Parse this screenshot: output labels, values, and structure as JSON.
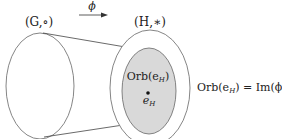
{
  "diagram": {
    "left_label": "(G,∘)",
    "right_label": "(H,∗)",
    "arrow_label": "ϕ",
    "inner_label": "Orb(e",
    "inner_label_sub": "H",
    "inner_label_close": ")",
    "point_label": "e",
    "point_label_sub": "H",
    "equation_lhs": "Orb(e",
    "equation_lhs_sub": "H",
    "equation_rest": ") = Im(ϕ)",
    "colors": {
      "stroke": "#666666",
      "inner_fill": "#d9d9d9",
      "text": "#222222"
    }
  }
}
